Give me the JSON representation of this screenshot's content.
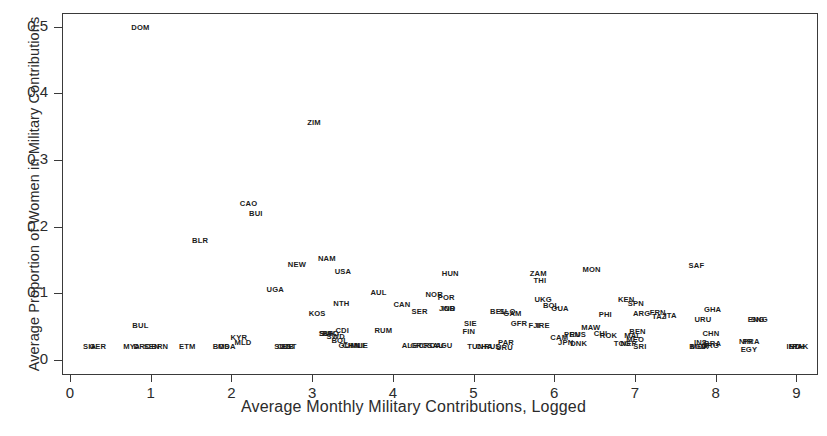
{
  "chart_data": {
    "type": "scatter",
    "title": "",
    "xlabel": "Average Monthly Military Contributions, Logged",
    "ylabel": "Average Proportion of Women in Military Contributions",
    "xlim": [
      -0.12,
      9.3
    ],
    "ylim": [
      -0.018,
      0.52
    ],
    "xticks": [
      "0",
      "1",
      "2",
      "3",
      "4",
      "5",
      "6",
      "7",
      "8",
      "9"
    ],
    "xtick_values": [
      0,
      1,
      2,
      3,
      4,
      5,
      6,
      7,
      8,
      9
    ],
    "yticks": [
      "0",
      "0.1",
      "0.2",
      "0.3",
      "0.4",
      "0.5"
    ],
    "ytick_values": [
      0,
      0.1,
      0.2,
      0.3,
      0.4,
      0.5
    ],
    "grid": false,
    "legend": null,
    "marker_style": "country-code-text-label",
    "points": [
      {
        "label": "DOM",
        "x": 0.86,
        "y": 0.5
      },
      {
        "label": "ZIM",
        "x": 3.01,
        "y": 0.357
      },
      {
        "label": "CAO",
        "x": 2.2,
        "y": 0.236
      },
      {
        "label": "BUI",
        "x": 2.29,
        "y": 0.22
      },
      {
        "label": "BLR",
        "x": 1.6,
        "y": 0.18
      },
      {
        "label": "NAM",
        "x": 3.17,
        "y": 0.153
      },
      {
        "label": "NEW",
        "x": 2.8,
        "y": 0.144
      },
      {
        "label": "SAF",
        "x": 7.75,
        "y": 0.143
      },
      {
        "label": "USA",
        "x": 3.37,
        "y": 0.133
      },
      {
        "label": "MON",
        "x": 6.45,
        "y": 0.137
      },
      {
        "label": "HUN",
        "x": 4.7,
        "y": 0.131
      },
      {
        "label": "ZAM",
        "x": 5.79,
        "y": 0.13
      },
      {
        "label": "THI",
        "x": 5.81,
        "y": 0.12
      },
      {
        "label": "UGA",
        "x": 2.53,
        "y": 0.106
      },
      {
        "label": "AUL",
        "x": 3.81,
        "y": 0.102
      },
      {
        "label": "NOR",
        "x": 4.5,
        "y": 0.099
      },
      {
        "label": "POR",
        "x": 4.65,
        "y": 0.094
      },
      {
        "label": "UKG",
        "x": 5.85,
        "y": 0.092
      },
      {
        "label": "KEN",
        "x": 6.88,
        "y": 0.092
      },
      {
        "label": "SPN",
        "x": 7.0,
        "y": 0.085
      },
      {
        "label": "NTH",
        "x": 3.35,
        "y": 0.085
      },
      {
        "label": "CAN",
        "x": 4.1,
        "y": 0.084
      },
      {
        "label": "BOL",
        "x": 5.95,
        "y": 0.082
      },
      {
        "label": "GUA",
        "x": 6.06,
        "y": 0.078
      },
      {
        "label": "GHA",
        "x": 7.95,
        "y": 0.077
      },
      {
        "label": "IND",
        "x": 4.68,
        "y": 0.078
      },
      {
        "label": "JOR",
        "x": 4.66,
        "y": 0.078
      },
      {
        "label": "SER",
        "x": 4.32,
        "y": 0.073
      },
      {
        "label": "KOS",
        "x": 3.05,
        "y": 0.071
      },
      {
        "label": "BEL",
        "x": 5.29,
        "y": 0.074
      },
      {
        "label": "SLO",
        "x": 5.41,
        "y": 0.074
      },
      {
        "label": "GAM",
        "x": 5.47,
        "y": 0.07
      },
      {
        "label": "ARG",
        "x": 7.07,
        "y": 0.07
      },
      {
        "label": "FRN",
        "x": 7.27,
        "y": 0.072
      },
      {
        "label": "TAZ",
        "x": 7.29,
        "y": 0.066
      },
      {
        "label": "ITA",
        "x": 7.43,
        "y": 0.068
      },
      {
        "label": "PHI",
        "x": 6.62,
        "y": 0.069
      },
      {
        "label": "URU",
        "x": 7.83,
        "y": 0.062
      },
      {
        "label": "ENG",
        "x": 8.49,
        "y": 0.061
      },
      {
        "label": "SNG",
        "x": 8.53,
        "y": 0.061
      },
      {
        "label": "BUL",
        "x": 0.86,
        "y": 0.052
      },
      {
        "label": "GFR",
        "x": 5.55,
        "y": 0.056
      },
      {
        "label": "FJI",
        "x": 5.74,
        "y": 0.052
      },
      {
        "label": "IRE",
        "x": 5.85,
        "y": 0.052
      },
      {
        "label": "SIE",
        "x": 4.95,
        "y": 0.055
      },
      {
        "label": "MAW",
        "x": 6.44,
        "y": 0.05
      },
      {
        "label": "FIN",
        "x": 4.93,
        "y": 0.044
      },
      {
        "label": "CHN",
        "x": 7.93,
        "y": 0.041
      },
      {
        "label": "BEN",
        "x": 7.02,
        "y": 0.043
      },
      {
        "label": "CHI",
        "x": 6.56,
        "y": 0.041
      },
      {
        "label": "ROK",
        "x": 6.66,
        "y": 0.038
      },
      {
        "label": "PEN",
        "x": 6.21,
        "y": 0.039
      },
      {
        "label": "RUS",
        "x": 6.28,
        "y": 0.039
      },
      {
        "label": "MAL",
        "x": 6.96,
        "y": 0.037
      },
      {
        "label": "MEO",
        "x": 6.99,
        "y": 0.032
      },
      {
        "label": "CAM",
        "x": 6.05,
        "y": 0.035
      },
      {
        "label": "JPN",
        "x": 6.13,
        "y": 0.027
      },
      {
        "label": "DNK",
        "x": 6.29,
        "y": 0.025
      },
      {
        "label": "TOG",
        "x": 6.83,
        "y": 0.025
      },
      {
        "label": "NEP",
        "x": 6.91,
        "y": 0.025
      },
      {
        "label": "SRI",
        "x": 7.05,
        "y": 0.021
      },
      {
        "label": "INS",
        "x": 7.8,
        "y": 0.027
      },
      {
        "label": "BRA",
        "x": 7.95,
        "y": 0.026
      },
      {
        "label": "MOR",
        "x": 7.79,
        "y": 0.021
      },
      {
        "label": "BGD",
        "x": 7.77,
        "y": 0.021
      },
      {
        "label": "GRG",
        "x": 7.92,
        "y": 0.022
      },
      {
        "label": "RUM",
        "x": 3.87,
        "y": 0.045
      },
      {
        "label": "SWD",
        "x": 3.28,
        "y": 0.036
      },
      {
        "label": "SUI",
        "x": 3.15,
        "y": 0.041
      },
      {
        "label": "SVK",
        "x": 3.18,
        "y": 0.041
      },
      {
        "label": "BFO",
        "x": 3.22,
        "y": 0.041
      },
      {
        "label": "CDI",
        "x": 3.36,
        "y": 0.045
      },
      {
        "label": "BOL2",
        "x": 3.33,
        "y": 0.03
      },
      {
        "label": "GUI",
        "x": 3.4,
        "y": 0.023
      },
      {
        "label": "CHN2",
        "x": 3.47,
        "y": 0.023
      },
      {
        "label": "MLI",
        "x": 3.55,
        "y": 0.023
      },
      {
        "label": "NIE",
        "x": 3.6,
        "y": 0.023
      },
      {
        "label": "ALG",
        "x": 4.2,
        "y": 0.022
      },
      {
        "label": "GRC",
        "x": 4.31,
        "y": 0.022
      },
      {
        "label": "CRO",
        "x": 4.41,
        "y": 0.022
      },
      {
        "label": "SAU",
        "x": 4.52,
        "y": 0.022
      },
      {
        "label": "AGU",
        "x": 4.62,
        "y": 0.022
      },
      {
        "label": "TUN",
        "x": 5.01,
        "y": 0.021
      },
      {
        "label": "CHA",
        "x": 5.12,
        "y": 0.021
      },
      {
        "label": "RUS2",
        "x": 5.22,
        "y": 0.021
      },
      {
        "label": "PAR",
        "x": 5.39,
        "y": 0.027
      },
      {
        "label": "URU2",
        "x": 5.37,
        "y": 0.02
      },
      {
        "label": "KYR",
        "x": 2.08,
        "y": 0.034
      },
      {
        "label": "MLD",
        "x": 2.13,
        "y": 0.027
      },
      {
        "label": "SUD",
        "x": 2.62,
        "y": 0.021
      },
      {
        "label": "CUB",
        "x": 2.66,
        "y": 0.021
      },
      {
        "label": "EST",
        "x": 2.7,
        "y": 0.021
      },
      {
        "label": "ETM",
        "x": 1.44,
        "y": 0.021
      },
      {
        "label": "BOS",
        "x": 1.86,
        "y": 0.021
      },
      {
        "label": "MDA",
        "x": 1.93,
        "y": 0.021
      },
      {
        "label": "SIA",
        "x": 0.23,
        "y": 0.021
      },
      {
        "label": "GER",
        "x": 0.33,
        "y": 0.021
      },
      {
        "label": "MYA",
        "x": 0.75,
        "y": 0.021
      },
      {
        "label": "DRC",
        "x": 0.88,
        "y": 0.021
      },
      {
        "label": "SEN",
        "x": 1.0,
        "y": 0.021
      },
      {
        "label": "BRN",
        "x": 1.1,
        "y": 0.021
      },
      {
        "label": "NIR",
        "x": 8.36,
        "y": 0.028
      },
      {
        "label": "PRA",
        "x": 8.43,
        "y": 0.028
      },
      {
        "label": "EGY",
        "x": 8.4,
        "y": 0.017
      },
      {
        "label": "IND2",
        "x": 8.95,
        "y": 0.021
      },
      {
        "label": "PAK",
        "x": 9.04,
        "y": 0.021
      },
      {
        "label": "ETH",
        "x": 8.99,
        "y": 0.021
      }
    ]
  },
  "axes": {
    "x_title": "Average Monthly Military Contributions, Logged",
    "y_title": "Average Proportion of Women in Military Contributions"
  }
}
